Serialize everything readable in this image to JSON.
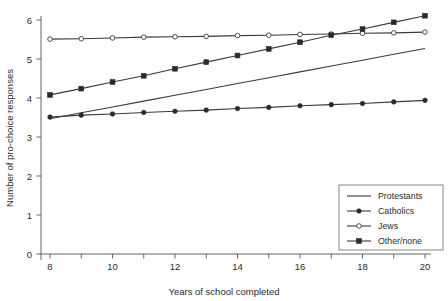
{
  "chart_data": {
    "type": "line",
    "title": "",
    "xlabel": "Years of school completed",
    "ylabel": "Number of pro-choice responses",
    "xlim": [
      8,
      20
    ],
    "ylim": [
      0,
      6
    ],
    "xticks": [
      8,
      9,
      10,
      11,
      12,
      13,
      14,
      15,
      16,
      17,
      18,
      19,
      20
    ],
    "xtick_labels": [
      "8",
      "",
      "10",
      "",
      "12",
      "",
      "14",
      "",
      "16",
      "",
      "18",
      "",
      "20"
    ],
    "yticks": [
      0,
      1,
      2,
      3,
      4,
      5,
      6
    ],
    "ytick_labels": [
      "0",
      "1",
      "2",
      "3",
      "4",
      "5",
      "6"
    ],
    "grid": false,
    "legend_position": "lower-right",
    "x": [
      8,
      9,
      10,
      11,
      12,
      13,
      14,
      15,
      16,
      17,
      18,
      19,
      20
    ],
    "series": [
      {
        "name": "Protestants",
        "marker": "none",
        "values": [
          3.47,
          3.62,
          3.77,
          3.92,
          4.07,
          4.22,
          4.37,
          4.52,
          4.67,
          4.82,
          4.97,
          5.12,
          5.27
        ]
      },
      {
        "name": "Catholics",
        "marker": "filled-circle",
        "values": [
          3.51,
          3.56,
          3.59,
          3.63,
          3.66,
          3.69,
          3.73,
          3.76,
          3.8,
          3.83,
          3.86,
          3.9,
          3.94
        ]
      },
      {
        "name": "Jews",
        "marker": "open-circle",
        "values": [
          5.51,
          5.52,
          5.54,
          5.56,
          5.57,
          5.58,
          5.6,
          5.61,
          5.63,
          5.64,
          5.66,
          5.67,
          5.69
        ]
      },
      {
        "name": "Other/none",
        "marker": "filled-square",
        "values": [
          4.08,
          4.24,
          4.41,
          4.57,
          4.75,
          4.92,
          5.09,
          5.26,
          5.43,
          5.61,
          5.77,
          5.94,
          6.11
        ]
      }
    ]
  },
  "legend": {
    "entries": [
      {
        "label": "Protestants",
        "marker": "none"
      },
      {
        "label": "Catholics",
        "marker": "filled-circle"
      },
      {
        "label": "Jews",
        "marker": "open-circle"
      },
      {
        "label": "Other/none",
        "marker": "filled-square"
      }
    ]
  },
  "colors": {
    "line": "#3a3a3a",
    "axis": "#555555",
    "text": "#2b2b2b",
    "background": "#ffffff"
  }
}
